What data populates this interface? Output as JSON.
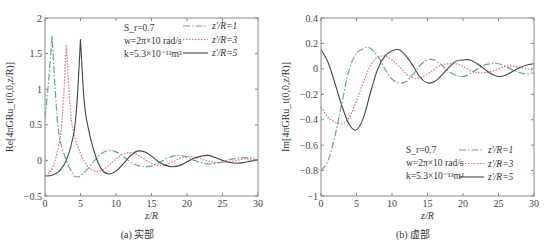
{
  "chart_data": [
    {
      "type": "line",
      "panel": "a",
      "caption": "(a) 实部",
      "title": "",
      "xlabel": "z/R",
      "ylabel": "Re[4πGRu_t(0,0,z/R)]",
      "xlim": [
        0,
        30
      ],
      "ylim": [
        -0.5,
        2
      ],
      "xticks": [
        "0",
        "5",
        "10",
        "15",
        "20",
        "25",
        "30"
      ],
      "yticks": [
        "-0.5",
        "0",
        "0.5",
        "1",
        "1.5",
        "2"
      ],
      "grid": false,
      "legend_position": "upper right",
      "annotations": [
        "S_r=0.7",
        "w=2π×10 rad/s",
        "k=5.3×10⁻¹³m²"
      ],
      "series": [
        {
          "name": "z'/R=1",
          "style": "dash-dot",
          "color": "#6aa39a",
          "x": [
            0,
            0.5,
            1,
            1.5,
            2,
            3,
            4,
            4.5,
            5,
            6,
            7,
            8,
            9,
            10,
            11,
            12,
            13,
            14,
            15,
            16,
            17,
            18,
            19,
            20,
            21,
            22,
            23,
            24,
            25,
            26,
            27,
            28,
            29,
            30
          ],
          "y": [
            0.6,
            1.1,
            1.75,
            0.9,
            0.35,
            0.0,
            -0.2,
            -0.23,
            -0.22,
            -0.12,
            0.0,
            0.1,
            0.14,
            0.12,
            0.06,
            -0.02,
            -0.07,
            -0.09,
            -0.08,
            -0.04,
            0.02,
            0.06,
            0.07,
            0.05,
            0.0,
            -0.03,
            -0.05,
            -0.04,
            -0.02,
            0.01,
            0.03,
            0.04,
            0.03,
            0.0
          ]
        },
        {
          "name": "z'/R=3",
          "style": "dotted",
          "color": "#e36a7a",
          "x": [
            0,
            1,
            2,
            2.5,
            3,
            3.5,
            4,
            5,
            6,
            7,
            8,
            9,
            10,
            11,
            12,
            13,
            14,
            15,
            16,
            17,
            18,
            19,
            20,
            21,
            22,
            23,
            24,
            25,
            26,
            27,
            28,
            29,
            30
          ],
          "y": [
            -0.2,
            -0.12,
            0.25,
            0.7,
            1.62,
            0.8,
            0.4,
            0.1,
            -0.08,
            -0.15,
            -0.14,
            -0.07,
            0.02,
            0.09,
            0.11,
            0.08,
            0.02,
            -0.04,
            -0.07,
            -0.06,
            -0.02,
            0.03,
            0.05,
            0.05,
            0.02,
            -0.01,
            -0.03,
            -0.03,
            -0.02,
            0.0,
            0.02,
            0.02,
            0.01
          ]
        },
        {
          "name": "z'/R=5",
          "style": "solid",
          "color": "#444444",
          "x": [
            0,
            1,
            2,
            3,
            4,
            4.5,
            5,
            5.5,
            6,
            7,
            8,
            9,
            10,
            11,
            12,
            13,
            14,
            15,
            16,
            17,
            18,
            19,
            20,
            21,
            22,
            23,
            24,
            25,
            26,
            27,
            28,
            29,
            30
          ],
          "y": [
            -0.22,
            -0.21,
            -0.15,
            0.0,
            0.35,
            0.8,
            1.7,
            0.85,
            0.5,
            0.1,
            -0.13,
            -0.19,
            -0.15,
            -0.05,
            0.06,
            0.13,
            0.12,
            0.06,
            -0.02,
            -0.07,
            -0.09,
            -0.07,
            -0.02,
            0.03,
            0.06,
            0.07,
            0.04,
            0.0,
            -0.03,
            -0.04,
            -0.03,
            -0.01,
            0.0
          ]
        }
      ]
    },
    {
      "type": "line",
      "panel": "b",
      "caption": "(b) 虚部",
      "title": "",
      "xlabel": "z/R",
      "ylabel": "Im[4πGRu_t(0,0,z/R)]",
      "xlim": [
        0,
        30
      ],
      "ylim": [
        -1,
        0.4
      ],
      "xticks": [
        "0",
        "5",
        "10",
        "15",
        "20",
        "25",
        "30"
      ],
      "yticks": [
        "-1",
        "-0.8",
        "-0.6",
        "-0.4",
        "-0.2",
        "0",
        "0.2",
        "0.4"
      ],
      "grid": false,
      "legend_position": "lower right",
      "annotations": [
        "S_r=0.7",
        "w=2π×10 rad/s",
        "k=5.3×10⁻¹³m²"
      ],
      "series": [
        {
          "name": "z'/R=1",
          "style": "dash-dot",
          "color": "#6aa39a",
          "x": [
            0,
            1,
            2,
            3,
            4,
            5,
            6,
            6.5,
            7,
            8,
            9,
            10,
            11,
            12,
            13,
            14,
            15,
            16,
            17,
            18,
            19,
            20,
            21,
            22,
            23,
            24,
            25,
            26,
            27,
            28,
            29,
            30
          ],
          "y": [
            -0.8,
            -0.72,
            -0.52,
            -0.25,
            0.0,
            0.12,
            0.16,
            0.17,
            0.16,
            0.1,
            0.0,
            -0.08,
            -0.11,
            -0.1,
            -0.04,
            0.03,
            0.07,
            0.07,
            0.03,
            -0.02,
            -0.05,
            -0.06,
            -0.04,
            0.0,
            0.03,
            0.04,
            0.04,
            0.02,
            -0.01,
            -0.03,
            -0.04,
            -0.03
          ]
        },
        {
          "name": "z'/R=3",
          "style": "dotted",
          "color": "#e36a7a",
          "x": [
            0,
            1,
            2,
            3,
            4,
            5,
            6,
            7,
            8,
            9,
            10,
            11,
            12,
            13,
            14,
            15,
            16,
            17,
            18,
            19,
            20,
            21,
            22,
            23,
            24,
            25,
            26,
            27,
            28,
            29,
            30
          ],
          "y": [
            -0.3,
            -0.38,
            -0.42,
            -0.43,
            -0.38,
            -0.25,
            -0.1,
            0.03,
            0.09,
            0.1,
            0.07,
            0.02,
            -0.04,
            -0.07,
            -0.07,
            -0.04,
            0.0,
            0.03,
            0.04,
            0.04,
            0.02,
            -0.01,
            -0.03,
            -0.03,
            -0.02,
            0.0,
            0.02,
            0.02,
            0.01,
            0.0,
            -0.01
          ]
        },
        {
          "name": "z'/R=5",
          "style": "solid",
          "color": "#444444",
          "x": [
            0,
            1,
            2,
            3,
            4,
            5,
            6,
            7,
            8,
            9,
            10,
            11,
            12,
            13,
            14,
            15,
            16,
            17,
            18,
            19,
            20,
            21,
            22,
            23,
            24,
            25,
            26,
            27,
            28,
            29,
            30
          ],
          "y": [
            0.15,
            0.05,
            -0.12,
            -0.3,
            -0.44,
            -0.48,
            -0.38,
            -0.18,
            0.0,
            0.1,
            0.14,
            0.15,
            0.1,
            0.02,
            -0.07,
            -0.11,
            -0.1,
            -0.05,
            0.01,
            0.06,
            0.07,
            0.07,
            0.04,
            0.0,
            -0.04,
            -0.06,
            -0.05,
            -0.02,
            0.01,
            0.03,
            0.04
          ]
        }
      ]
    }
  ]
}
